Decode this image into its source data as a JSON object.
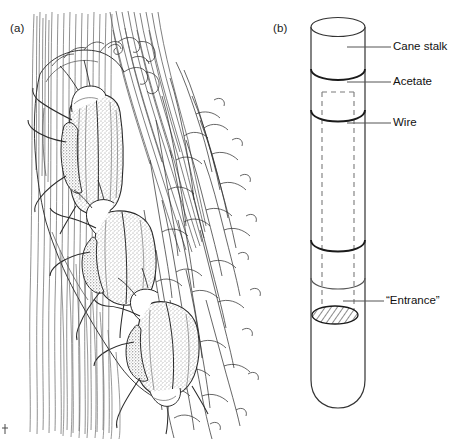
{
  "figure": {
    "type": "scientific-line-illustration",
    "background_color": "#ffffff",
    "ink_color": "#1a1a1a",
    "panels": [
      {
        "id": "a",
        "label": "(a)",
        "subject": "Ink drawing of three beetles on sugarcane stalk fibres and root mass",
        "elements": [
          "vertical-stalk-fibres",
          "diagonal-fibre-bundle",
          "beetle-upper",
          "beetle-middle",
          "beetle-lower",
          "root-hair-mass"
        ],
        "beetle_count": 3
      },
      {
        "id": "b",
        "label": "(b)",
        "subject": "Diagram of cane stalk trap with acetate sleeve, wire and entrance hole",
        "callouts": [
          {
            "id": "cane-stalk",
            "label": "Cane stalk"
          },
          {
            "id": "acetate",
            "label": "Acetate"
          },
          {
            "id": "wire",
            "label": "Wire"
          },
          {
            "id": "entrance",
            "label": "“Entrance”"
          }
        ]
      }
    ]
  }
}
